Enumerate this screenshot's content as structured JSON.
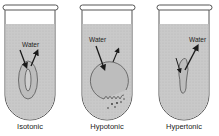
{
  "diagram": {
    "colors": {
      "liquid": "#c9c9c9",
      "glass": "#ffffff",
      "outline": "#555555",
      "cell": "#d8d8d8",
      "arrow": "#1a1a1a"
    },
    "tubes": [
      {
        "id": "isotonic",
        "label": "Isotonic",
        "water_label": "Water",
        "cell_shape": "oval-with-inner-oval",
        "arrows": [
          "in",
          "out"
        ]
      },
      {
        "id": "hypotonic",
        "label": "Hypotonic",
        "water_label": "Water",
        "cell_shape": "swollen-bursting-circle",
        "arrows": [
          "in",
          "out"
        ]
      },
      {
        "id": "hypertonic",
        "label": "Hypertonic",
        "water_label": "Water",
        "cell_shape": "shrunken-crenated",
        "arrows": [
          "in",
          "out"
        ]
      }
    ]
  }
}
